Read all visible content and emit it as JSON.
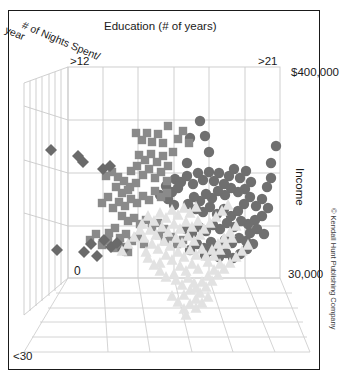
{
  "figure": {
    "title": "Education (# of years)",
    "depth_axis_label_line1": "# of Nights Spent/",
    "depth_axis_label_line2": "year",
    "vertical_axis_label": "Income",
    "copyright": "© Kendall Hunt Publishing Company"
  },
  "ticks": {
    "education_min": ">12",
    "education_max": ">21",
    "income_max": "$400,000",
    "income_min": "30,000",
    "nights_max": "0",
    "nights_min": "<30"
  },
  "colors": {
    "circle_marker": "#6f6f6f",
    "square_marker": "#8a8a8a",
    "diamond_marker": "#6a6a6a",
    "triangle_marker": "#e2e2e2",
    "grid_line": "#c9c9c9",
    "floor_line": "#cfcfcf",
    "frame": "#1a1a1a",
    "text": "#1a1a1a",
    "background": "#ffffff"
  },
  "chart_data": {
    "type": "scatter",
    "title": "Education (# of years)",
    "xlabel": "Education (# of years)",
    "ylabel": "Income",
    "zlabel": "# of Nights Spent/ year",
    "projection": "3d",
    "grid": true,
    "legend": null,
    "xlim_labels": [
      ">12",
      ">21"
    ],
    "ylim_labels": [
      "30,000",
      "$400,000"
    ],
    "zlim_labels": [
      "<30",
      "0"
    ],
    "series": [
      {
        "name": "circles",
        "marker": "circle",
        "color": "#6f6f6f",
        "points": [
          [
            200,
            121
          ],
          [
            190,
            138
          ],
          [
            205,
            136
          ],
          [
            209,
            152
          ],
          [
            187,
            163
          ],
          [
            175,
            179
          ],
          [
            181,
            182
          ],
          [
            187,
            176
          ],
          [
            193,
            184
          ],
          [
            198,
            173
          ],
          [
            203,
            180
          ],
          [
            209,
            172
          ],
          [
            214,
            181
          ],
          [
            219,
            173
          ],
          [
            224,
            184
          ],
          [
            229,
            176
          ],
          [
            234,
            169
          ],
          [
            240,
            178
          ],
          [
            246,
            171
          ],
          [
            251,
            182
          ],
          [
            245,
            189
          ],
          [
            238,
            192
          ],
          [
            231,
            188
          ],
          [
            225,
            195
          ],
          [
            218,
            191
          ],
          [
            212,
            198
          ],
          [
            206,
            194
          ],
          [
            200,
            201
          ],
          [
            194,
            197
          ],
          [
            188,
            204
          ],
          [
            196,
            209
          ],
          [
            203,
            212
          ],
          [
            210,
            207
          ],
          [
            217,
            214
          ],
          [
            224,
            209
          ],
          [
            231,
            216
          ],
          [
            238,
            211
          ],
          [
            244,
            204
          ],
          [
            250,
            197
          ],
          [
            256,
            206
          ],
          [
            262,
            199
          ],
          [
            268,
            208
          ],
          [
            262,
            216
          ],
          [
            255,
            220
          ],
          [
            248,
            224
          ],
          [
            241,
            221
          ],
          [
            234,
            227
          ],
          [
            227,
            223
          ],
          [
            220,
            229
          ],
          [
            213,
            225
          ],
          [
            206,
            231
          ],
          [
            199,
            227
          ],
          [
            192,
            233
          ],
          [
            186,
            229
          ],
          [
            250,
            233
          ],
          [
            257,
            229
          ],
          [
            264,
            234
          ],
          [
            271,
            163
          ],
          [
            276,
            146
          ],
          [
            271,
            178
          ],
          [
            267,
            187
          ],
          [
            246,
            241
          ],
          [
            239,
            238
          ],
          [
            232,
            243
          ],
          [
            225,
            240
          ],
          [
            218,
            246
          ],
          [
            211,
            242
          ],
          [
            204,
            248
          ],
          [
            197,
            244
          ],
          [
            190,
            250
          ],
          [
            205,
            255
          ],
          [
            212,
            251
          ],
          [
            219,
            257
          ],
          [
            226,
            253
          ],
          [
            233,
            258
          ],
          [
            240,
            254
          ],
          [
            247,
            249
          ],
          [
            253,
            244
          ],
          [
            166,
            186
          ],
          [
            172,
            192
          ],
          [
            178,
            188
          ],
          [
            160,
            195
          ],
          [
            168,
            199
          ],
          [
            174,
            205
          ]
        ]
      },
      {
        "name": "squares",
        "marker": "square",
        "color": "#8a8a8a",
        "points": [
          [
            168,
            126
          ],
          [
            136,
            133
          ],
          [
            142,
            140
          ],
          [
            147,
            133
          ],
          [
            152,
            142
          ],
          [
            158,
            134
          ],
          [
            163,
            143
          ],
          [
            178,
            139
          ],
          [
            183,
            131
          ],
          [
            189,
            143
          ],
          [
            173,
            152
          ],
          [
            139,
            155
          ],
          [
            145,
            160
          ],
          [
            151,
            154
          ],
          [
            157,
            162
          ],
          [
            163,
            156
          ],
          [
            168,
            166
          ],
          [
            131,
            171
          ],
          [
            137,
            166
          ],
          [
            143,
            175
          ],
          [
            149,
            169
          ],
          [
            155,
            178
          ],
          [
            161,
            172
          ],
          [
            167,
            181
          ],
          [
            124,
            181
          ],
          [
            130,
            187
          ],
          [
            136,
            183
          ],
          [
            118,
            177
          ],
          [
            112,
            172
          ],
          [
            106,
            176
          ],
          [
            116,
            187
          ],
          [
            122,
            193
          ],
          [
            128,
            190
          ],
          [
            155,
            191
          ],
          [
            161,
            197
          ],
          [
            167,
            193
          ],
          [
            149,
            200
          ],
          [
            143,
            196
          ],
          [
            137,
            203
          ],
          [
            131,
            199
          ],
          [
            125,
            206
          ],
          [
            119,
            202
          ],
          [
            113,
            208
          ],
          [
            108,
            197
          ],
          [
            102,
            203
          ],
          [
            122,
            216
          ],
          [
            128,
            221
          ],
          [
            134,
            218
          ],
          [
            140,
            224
          ],
          [
            146,
            220
          ],
          [
            152,
            227
          ],
          [
            158,
            223
          ],
          [
            164,
            229
          ],
          [
            115,
            228
          ],
          [
            109,
            233
          ],
          [
            120,
            238
          ],
          [
            126,
            234
          ],
          [
            132,
            241
          ],
          [
            138,
            237
          ],
          [
            144,
            244
          ],
          [
            96,
            234
          ],
          [
            90,
            240
          ],
          [
            102,
            245
          ],
          [
            108,
            241
          ],
          [
            114,
            248
          ],
          [
            159,
            235
          ],
          [
            165,
            241
          ],
          [
            171,
            237
          ],
          [
            177,
            244
          ],
          [
            183,
            240
          ],
          [
            122,
            247
          ],
          [
            128,
            252
          ]
        ]
      },
      {
        "name": "diamonds",
        "marker": "diamond",
        "color": "#6a6a6a",
        "points": [
          [
            51,
            150
          ],
          [
            78,
            156
          ],
          [
            83,
            162
          ],
          [
            103,
            169
          ],
          [
            110,
            166
          ],
          [
            91,
            244
          ],
          [
            84,
            252
          ],
          [
            104,
            240
          ],
          [
            111,
            247
          ],
          [
            117,
            243
          ],
          [
            57,
            250
          ],
          [
            97,
            256
          ],
          [
            123,
            250
          ]
        ]
      },
      {
        "name": "triangles",
        "marker": "triangle",
        "color": "#e2e2e2",
        "points": [
          [
            184,
            208
          ],
          [
            190,
            213
          ],
          [
            196,
            207
          ],
          [
            178,
            215
          ],
          [
            172,
            210
          ],
          [
            166,
            218
          ],
          [
            160,
            213
          ],
          [
            154,
            221
          ],
          [
            148,
            216
          ],
          [
            142,
            224
          ],
          [
            186,
            222
          ],
          [
            192,
            227
          ],
          [
            198,
            221
          ],
          [
            180,
            229
          ],
          [
            174,
            224
          ],
          [
            168,
            232
          ],
          [
            162,
            227
          ],
          [
            156,
            235
          ],
          [
            150,
            230
          ],
          [
            144,
            238
          ],
          [
            188,
            236
          ],
          [
            194,
            241
          ],
          [
            200,
            235
          ],
          [
            182,
            243
          ],
          [
            176,
            238
          ],
          [
            170,
            246
          ],
          [
            164,
            241
          ],
          [
            158,
            249
          ],
          [
            152,
            244
          ],
          [
            146,
            252
          ],
          [
            190,
            250
          ],
          [
            196,
            255
          ],
          [
            202,
            249
          ],
          [
            184,
            257
          ],
          [
            178,
            252
          ],
          [
            172,
            260
          ],
          [
            166,
            255
          ],
          [
            160,
            263
          ],
          [
            192,
            264
          ],
          [
            198,
            269
          ],
          [
            186,
            271
          ],
          [
            180,
            266
          ],
          [
            174,
            274
          ],
          [
            188,
            278
          ],
          [
            194,
            283
          ],
          [
            182,
            285
          ],
          [
            176,
            280
          ],
          [
            190,
            290
          ],
          [
            184,
            295
          ],
          [
            196,
            288
          ],
          [
            202,
            282
          ],
          [
            208,
            276
          ],
          [
            214,
            270
          ],
          [
            220,
            264
          ],
          [
            208,
            262
          ],
          [
            214,
            256
          ],
          [
            220,
            250
          ],
          [
            226,
            244
          ],
          [
            232,
            238
          ],
          [
            204,
            229
          ],
          [
            210,
            223
          ],
          [
            216,
            217
          ],
          [
            222,
            211
          ],
          [
            228,
            205
          ],
          [
            140,
            230
          ],
          [
            134,
            237
          ],
          [
            128,
            244
          ],
          [
            122,
            251
          ],
          [
            148,
            258
          ],
          [
            154,
            265
          ],
          [
            160,
            271
          ],
          [
            166,
            277
          ],
          [
            196,
            299
          ],
          [
            190,
            304
          ],
          [
            184,
            309
          ],
          [
            178,
            302
          ],
          [
            172,
            296
          ],
          [
            186,
            315
          ],
          [
            200,
            293
          ],
          [
            206,
            287
          ],
          [
            212,
            281
          ],
          [
            218,
            275
          ],
          [
            224,
            269
          ],
          [
            230,
            263
          ],
          [
            236,
            257
          ],
          [
            242,
            251
          ],
          [
            248,
            245
          ],
          [
            202,
            303
          ],
          [
            196,
            308
          ],
          [
            208,
            297
          ],
          [
            230,
            232
          ],
          [
            236,
            226
          ],
          [
            224,
            238
          ],
          [
            218,
            244
          ],
          [
            212,
            250
          ],
          [
            206,
            256
          ]
        ]
      }
    ]
  }
}
